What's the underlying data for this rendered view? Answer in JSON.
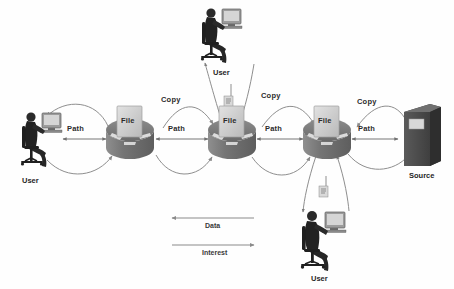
{
  "diagram": {
    "background": "#fefefe",
    "colors": {
      "node_dark": "#6e6e6e",
      "node_light": "#9a9a9a",
      "file_fill": "#cfcfcf",
      "source_fill": "#4a4a4a",
      "arrow_stroke": "#8a8a8a",
      "path_stroke": "#777777",
      "person_dark": "#262626",
      "text": "#2b2b2b"
    }
  },
  "routers": [
    {
      "id": "router-left",
      "file_label": "File",
      "x": 130,
      "y": 138
    },
    {
      "id": "router-middle",
      "file_label": "File",
      "x": 232,
      "y": 138
    },
    {
      "id": "router-right",
      "file_label": "File",
      "x": 327,
      "y": 138
    }
  ],
  "endpoints": [
    {
      "id": "user-left",
      "label": "User",
      "kind": "workstation"
    },
    {
      "id": "user-top",
      "label": "User",
      "kind": "workstation"
    },
    {
      "id": "user-bottom",
      "label": "User",
      "kind": "workstation"
    },
    {
      "id": "source",
      "label": "Source",
      "kind": "server"
    }
  ],
  "edge_labels": {
    "path": "Path",
    "copy": "Copy",
    "path_occurrences": 4,
    "copy_occurrences": 3
  },
  "labels": {
    "path_1": "Path",
    "path_2": "Path",
    "path_3": "Path",
    "path_4": "Path",
    "copy_1": "Copy",
    "copy_2": "Copy",
    "copy_3": "Copy",
    "user_left": "User",
    "user_top": "User",
    "user_bottom": "User",
    "source": "Source",
    "file_1": "File",
    "file_2": "File",
    "file_3": "File"
  },
  "legend": {
    "items": [
      {
        "label": "Data",
        "direction": "left",
        "stroke": "#8a8a8a"
      },
      {
        "label": "Interest",
        "direction": "right",
        "stroke": "#8a8a8a"
      }
    ]
  }
}
